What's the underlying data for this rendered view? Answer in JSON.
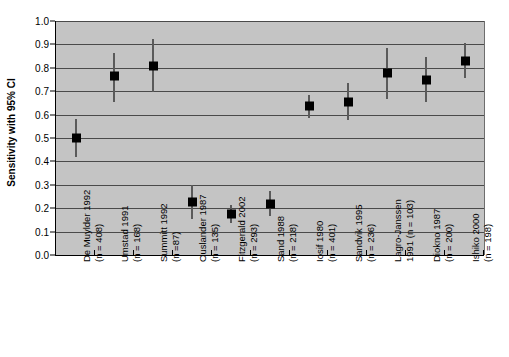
{
  "chart_data": {
    "type": "scatter",
    "title": "",
    "xlabel": "",
    "ylabel": "Sensitivity with 95% CI",
    "ylim": [
      0.0,
      1.0
    ],
    "ytick_labels": [
      "0.0",
      "0.1",
      "0.2",
      "0.3",
      "0.4",
      "0.5",
      "0.6",
      "0.7",
      "0.8",
      "0.9",
      "1.0"
    ],
    "ytick_values": [
      0.0,
      0.1,
      0.2,
      0.3,
      0.4,
      0.5,
      0.6,
      0.7,
      0.8,
      0.9,
      1.0
    ],
    "grid": true,
    "legend": "none",
    "plot_background": "#c4c4c4",
    "marker_color": "#000000",
    "errorbar_color": "#5a5a5a",
    "categories": [
      "De Muylder 1992 (n = 408)",
      "Umstad 1991 (n = 168)",
      "Summitt 1992 (n =87)",
      "Ouslander 1987 (n = 135)",
      "Fitzgerald 2002 (n = 293)",
      "Sand 1988 (n = 218)",
      "Iosif 1980 (n = 401)",
      "Sandvik 1995 (n = 236)",
      "Lagro-Janssen 1991 (n = 103)",
      "Diokno 1987 (n = 200)",
      "Ishiko 2000 (n = 198)"
    ],
    "points": [
      {
        "label_line1": "De Muylder 1992",
        "label_line2": "(n = 408)",
        "study": "De Muylder",
        "year": "1992",
        "n": "408",
        "value": 0.5,
        "ci_low": 0.42,
        "ci_high": 0.58
      },
      {
        "label_line1": "Umstad 1991",
        "label_line2": "(n = 168)",
        "study": "Umstad",
        "year": "1991",
        "n": "168",
        "value": 0.765,
        "ci_low": 0.655,
        "ci_high": 0.865
      },
      {
        "label_line1": "Summitt 1992",
        "label_line2": "(n =87)",
        "study": "Summitt",
        "year": "1992",
        "n": "87",
        "value": 0.81,
        "ci_low": 0.695,
        "ci_high": 0.925
      },
      {
        "label_line1": "Ouslander 1987",
        "label_line2": "(n = 135)",
        "study": "Ouslander",
        "year": "1987",
        "n": "135",
        "value": 0.225,
        "ci_low": 0.155,
        "ci_high": 0.3
      },
      {
        "label_line1": "Fitzgerald 2002",
        "label_line2": "(n = 293)",
        "study": "Fitzgerald",
        "year": "2002",
        "n": "293",
        "value": 0.175,
        "ci_low": 0.135,
        "ci_high": 0.215
      },
      {
        "label_line1": "Sand 1988",
        "label_line2": "(n = 218)",
        "study": "Sand",
        "year": "1988",
        "n": "218",
        "value": 0.22,
        "ci_low": 0.165,
        "ci_high": 0.275
      },
      {
        "label_line1": "Iosif 1980",
        "label_line2": "(n = 401)",
        "study": "Iosif",
        "year": "1980",
        "n": "401",
        "value": 0.635,
        "ci_low": 0.585,
        "ci_high": 0.685
      },
      {
        "label_line1": "Sandvik 1995",
        "label_line2": "(n = 236)",
        "study": "Sandvik",
        "year": "1995",
        "n": "236",
        "value": 0.655,
        "ci_low": 0.575,
        "ci_high": 0.735
      },
      {
        "label_line1": "Lagro-Janssen",
        "label_line2": "1991 (n = 103)",
        "study": "Lagro-Janssen",
        "year": "1991",
        "n": "103",
        "value": 0.78,
        "ci_low": 0.665,
        "ci_high": 0.885
      },
      {
        "label_line1": "Diokno 1987",
        "label_line2": "(n = 200)",
        "study": "Diokno",
        "year": "1987",
        "n": "200",
        "value": 0.75,
        "ci_low": 0.655,
        "ci_high": 0.845
      },
      {
        "label_line1": "Ishiko 2000",
        "label_line2": "(n = 198)",
        "study": "Ishiko",
        "year": "2000",
        "n": "198",
        "value": 0.83,
        "ci_low": 0.755,
        "ci_high": 0.905
      }
    ]
  }
}
